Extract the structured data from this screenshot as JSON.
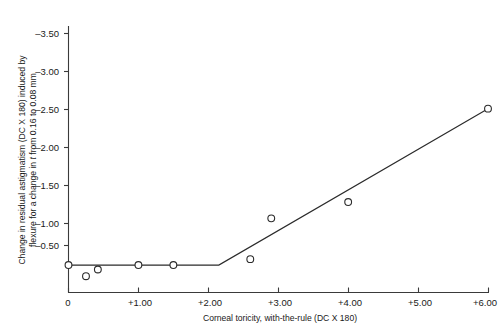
{
  "chart_data": {
    "type": "line",
    "title": "",
    "xlabel": "Corneal toricity, with-the-rule (DC X 180)",
    "ylabel_line1": "Change in residual astigmatism (DC X 180) induced by",
    "ylabel_line2_pre": "flexure for a change in ",
    "ylabel_line2_italic": "t",
    "ylabel_line2_post": " from 0.16 to 0.08 mm",
    "xlim": [
      0,
      6.0
    ],
    "ylim": [
      -3.75,
      0
    ],
    "grid": false,
    "legend": null,
    "xticks": [
      0,
      1.0,
      2.0,
      3.0,
      4.0,
      5.0,
      6.0
    ],
    "xticklabels": [
      "0",
      "+1.00",
      "+2.00",
      "+3.00",
      "+4.00",
      "+5.00",
      "+6.00"
    ],
    "yticks": [
      -3.5,
      -3.0,
      -2.5,
      -2.0,
      -1.5,
      -1.0,
      -0.5
    ],
    "yticklabels": [
      "–3.50",
      "–3.00",
      "–2.50",
      "–2.00",
      "–1.50",
      "–1.00",
      "–0.50"
    ],
    "series": [
      {
        "name": "fitted-model-line",
        "type": "line",
        "x": [
          0.0,
          2.15,
          6.0
        ],
        "y": [
          -0.37,
          -0.37,
          -2.48
        ]
      }
    ],
    "markers_on_line": {
      "name": "data-points-on-line",
      "x": [
        0.0,
        1.0,
        1.5,
        2.6,
        4.0,
        6.0
      ],
      "y": [
        -0.37,
        -0.37,
        -0.37,
        -0.45,
        -1.22,
        -2.48
      ]
    },
    "scatter_points": {
      "name": "off-line-data-points",
      "x": [
        0.25,
        0.42,
        2.9
      ],
      "y": [
        -0.22,
        -0.31,
        -1.0
      ]
    }
  }
}
